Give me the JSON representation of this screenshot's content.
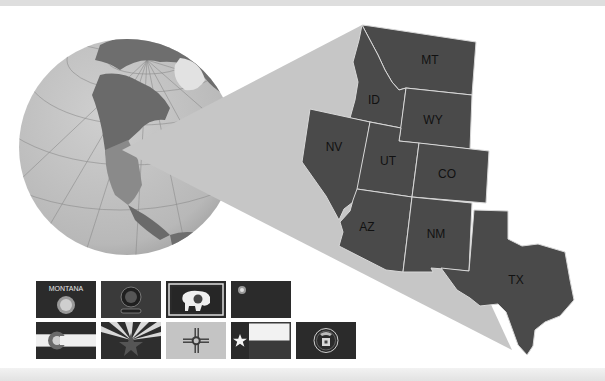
{
  "figure": {
    "colors": {
      "state_fill": "#4a4a4a",
      "state_border": "#d8d8d8",
      "cone_fill": "#c6c6c6",
      "ocean": "#bdbdbd",
      "land_dark": "#6a6a6a",
      "band": "#dedede"
    },
    "states": [
      {
        "abbr": "MT",
        "label_x": 430,
        "label_y": 64
      },
      {
        "abbr": "ID",
        "label_x": 374,
        "label_y": 104
      },
      {
        "abbr": "WY",
        "label_x": 433,
        "label_y": 124
      },
      {
        "abbr": "NV",
        "label_x": 334,
        "label_y": 151
      },
      {
        "abbr": "UT",
        "label_x": 388,
        "label_y": 165
      },
      {
        "abbr": "CO",
        "label_x": 447,
        "label_y": 178
      },
      {
        "abbr": "AZ",
        "label_x": 367,
        "label_y": 231
      },
      {
        "abbr": "NM",
        "label_x": 436,
        "label_y": 238
      },
      {
        "abbr": "TX",
        "label_x": 516,
        "label_y": 284
      }
    ],
    "flags": [
      {
        "state": "Montana",
        "text": "MONTANA",
        "row": 1,
        "col": 1
      },
      {
        "state": "Idaho",
        "row": 1,
        "col": 2
      },
      {
        "state": "Wyoming",
        "row": 1,
        "col": 3
      },
      {
        "state": "Nevada",
        "row": 1,
        "col": 4
      },
      {
        "state": "Colorado",
        "row": 2,
        "col": 1
      },
      {
        "state": "Arizona",
        "row": 2,
        "col": 2
      },
      {
        "state": "New Mexico",
        "row": 2,
        "col": 3
      },
      {
        "state": "Texas",
        "row": 2,
        "col": 4
      },
      {
        "state": "Utah",
        "row": 2,
        "col": 5
      }
    ]
  }
}
